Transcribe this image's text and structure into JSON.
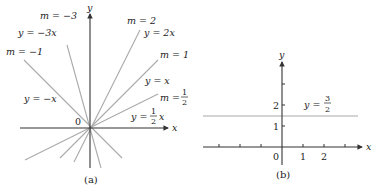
{
  "panel_a": {
    "caption": "(a)",
    "x_axis_label": "x",
    "y_axis_label": "y",
    "origin_label": "0",
    "lines": [
      {
        "slope": -3,
        "m_label": "m = −3",
        "eq_label": "y = −3x"
      },
      {
        "slope": -1,
        "m_label": "m = −1",
        "eq_label": "y = −x"
      },
      {
        "slope": 2,
        "m_label": "m = 2",
        "eq_label": "y = 2x"
      },
      {
        "slope": 1,
        "m_label": "m = 1",
        "eq_label": "y = x"
      },
      {
        "slope": 0.5,
        "m_label_prefix": "m =",
        "eq_label_prefix": "y =",
        "eq_label_suffix": "x",
        "frac_num": "1",
        "frac_den": "2"
      }
    ]
  },
  "panel_b": {
    "caption": "(b)",
    "x_axis_label": "x",
    "y_axis_label": "y",
    "origin_label": "0",
    "x_ticks": [
      "1",
      "2"
    ],
    "y_ticks": [
      "1",
      "2"
    ],
    "line": {
      "eq_prefix": "y =",
      "frac_num": "3",
      "frac_den": "2",
      "value": 1.5
    }
  }
}
